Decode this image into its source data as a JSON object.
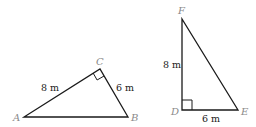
{
  "diagram": {
    "triangles": [
      {
        "name": "ABC",
        "vertices": {
          "A": {
            "label": "A"
          },
          "B": {
            "label": "B"
          },
          "C": {
            "label": "C"
          }
        },
        "right_angle_at": "C",
        "sides": {
          "AC": {
            "label": "8 m"
          },
          "CB": {
            "label": "6 m"
          }
        }
      },
      {
        "name": "DEF",
        "vertices": {
          "D": {
            "label": "D"
          },
          "E": {
            "label": "E"
          },
          "F": {
            "label": "F"
          }
        },
        "right_angle_at": "D",
        "sides": {
          "FD": {
            "label": "8 m"
          },
          "DE": {
            "label": "6 m"
          }
        }
      }
    ],
    "colors": {
      "line": "#1a1a1a",
      "vertex_label": "#8a8a8a",
      "measure_label": "#1a1a1a"
    }
  }
}
